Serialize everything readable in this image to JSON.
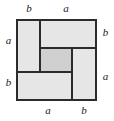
{
  "figure": {
    "outer_square": {
      "x": 16,
      "y": 19,
      "side": 81,
      "side_label_expression": "a + b",
      "stroke_color": "#2b2b2b",
      "stroke_width": 2,
      "fill_color": "#e6e6e6"
    },
    "center_square": {
      "x": 40,
      "y": 48,
      "width": 32,
      "height": 24,
      "side_label_expression": "a - b",
      "fill_color": "#d0d0d0",
      "stroke_color": "#2b2b2b",
      "stroke_width": 2
    },
    "rectangles": [
      {
        "name": "top-left-rectangle",
        "x": 16,
        "y": 19,
        "width": 24,
        "height": 53,
        "short_side": "b",
        "long_side": "a",
        "fill_color": "#e6e6e6"
      },
      {
        "name": "top-right-rectangle",
        "x": 40,
        "y": 19,
        "width": 57,
        "height": 29,
        "short_side": "b",
        "long_side": "a",
        "fill_color": "#e6e6e6"
      },
      {
        "name": "bottom-right-rectangle",
        "x": 72,
        "y": 48,
        "width": 25,
        "height": 53,
        "short_side": "b",
        "long_side": "a",
        "fill_color": "#e6e6e6"
      },
      {
        "name": "bottom-left-rectangle",
        "x": 16,
        "y": 72,
        "width": 56,
        "height": 29,
        "short_side": "b",
        "long_side": "a",
        "fill_color": "#e6e6e6"
      }
    ],
    "divider_lines": [
      {
        "name": "vertical-divider-top",
        "x1": 40,
        "y1": 19,
        "x2": 40,
        "y2": 72
      },
      {
        "name": "horizontal-divider-right",
        "x1": 40,
        "y1": 48,
        "x2": 97,
        "y2": 48
      },
      {
        "name": "vertical-divider-bottom",
        "x1": 72,
        "y1": 48,
        "x2": 72,
        "y2": 101
      },
      {
        "name": "horizontal-divider-left",
        "x1": 16,
        "y1": 72,
        "x2": 72,
        "y2": 72
      }
    ]
  },
  "labels": {
    "top_left": "b",
    "top_right": "a",
    "left_upper": "a",
    "left_lower": "b",
    "right_upper": "b",
    "right_lower": "a",
    "bottom_left": "a",
    "bottom_right": "b"
  },
  "colors": {
    "background": "#ffffff",
    "fill_light": "#e6e6e6",
    "fill_center": "#d0d0d0",
    "stroke": "#2b2b2b",
    "text": "#1a1a1a"
  }
}
